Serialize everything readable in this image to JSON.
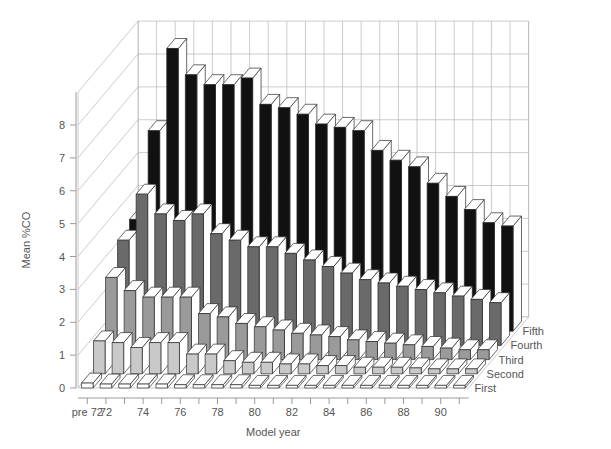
{
  "chart_data": {
    "type": "bar",
    "render": "3d-bar",
    "title": "",
    "subtitle": "",
    "xlabel": "Model year",
    "ylabel": "Mean %CO",
    "zlabel": "",
    "ylim": [
      0,
      9
    ],
    "yticks": [
      0,
      1,
      2,
      3,
      4,
      5,
      6,
      7,
      8
    ],
    "ytick_labels": [
      "0",
      "1",
      "2",
      "3",
      "4",
      "5",
      "6",
      "7",
      "8"
    ],
    "grid": true,
    "legend_position": "right-depth-axis",
    "categories": [
      "pre 72",
      "72",
      "73",
      "74",
      "75",
      "76",
      "77",
      "78",
      "79",
      "80",
      "81",
      "82",
      "83",
      "84",
      "85",
      "86",
      "87",
      "88",
      "89",
      "90",
      "91"
    ],
    "xtick_labels": [
      "pre 72",
      "72",
      "",
      "74",
      "",
      "76",
      "",
      "78",
      "",
      "80",
      "",
      "82",
      "",
      "84",
      "",
      "86",
      "",
      "88",
      "",
      "90",
      ""
    ],
    "series": [
      {
        "name": "First",
        "color": "#ffffff",
        "values": [
          0.15,
          0.12,
          0.12,
          0.12,
          0.12,
          0.1,
          0.1,
          0.1,
          0.1,
          0.08,
          0.08,
          0.08,
          0.08,
          0.08,
          0.08,
          0.08,
          0.08,
          0.08,
          0.08,
          0.08,
          0.08
        ]
      },
      {
        "name": "Second",
        "color": "#c9c9c9",
        "values": [
          1.0,
          0.95,
          0.8,
          0.95,
          0.95,
          0.6,
          0.6,
          0.4,
          0.35,
          0.35,
          0.3,
          0.3,
          0.25,
          0.25,
          0.2,
          0.2,
          0.2,
          0.18,
          0.15,
          0.15,
          0.15
        ]
      },
      {
        "name": "Third",
        "color": "#9a9a9a",
        "values": [
          2.5,
          2.1,
          1.9,
          1.9,
          1.9,
          1.4,
          1.3,
          1.1,
          1.0,
          0.9,
          0.8,
          0.75,
          0.7,
          0.6,
          0.55,
          0.5,
          0.45,
          0.4,
          0.35,
          0.3,
          0.3
        ]
      },
      {
        "name": "Fourth",
        "color": "#6a6a6a",
        "values": [
          3.2,
          4.6,
          4.0,
          3.8,
          4.0,
          3.4,
          3.2,
          3.0,
          3.0,
          2.8,
          2.6,
          2.4,
          2.2,
          2.0,
          1.9,
          1.8,
          1.7,
          1.6,
          1.5,
          1.4,
          1.3
        ]
      },
      {
        "name": "Fifth",
        "color": "#111111",
        "values": [
          3.4,
          6.1,
          8.6,
          7.8,
          7.5,
          7.5,
          7.7,
          6.9,
          6.8,
          6.6,
          6.3,
          6.2,
          6.1,
          5.5,
          5.2,
          5.0,
          4.5,
          4.1,
          3.7,
          3.3,
          3.2
        ]
      }
    ]
  }
}
